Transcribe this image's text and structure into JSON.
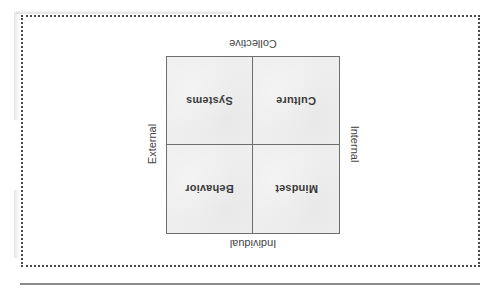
{
  "diagram": {
    "type": "2x2 quadrant (printed upside down)",
    "orientation": "rotated 180 degrees",
    "axes": {
      "top": "Collective",
      "bottom": "Individual",
      "left": "External",
      "right": "Internal"
    },
    "quadrants": {
      "top_left": "Systems",
      "top_right": "Culture",
      "bottom_left": "Behavior",
      "bottom_right": "Mindset"
    }
  },
  "colors": {
    "frame_dots": "#4a4a4a",
    "grid_lines": "#6e6e6e",
    "quadrant_fill": "#eeeeee",
    "text": "#3a3a3a"
  }
}
